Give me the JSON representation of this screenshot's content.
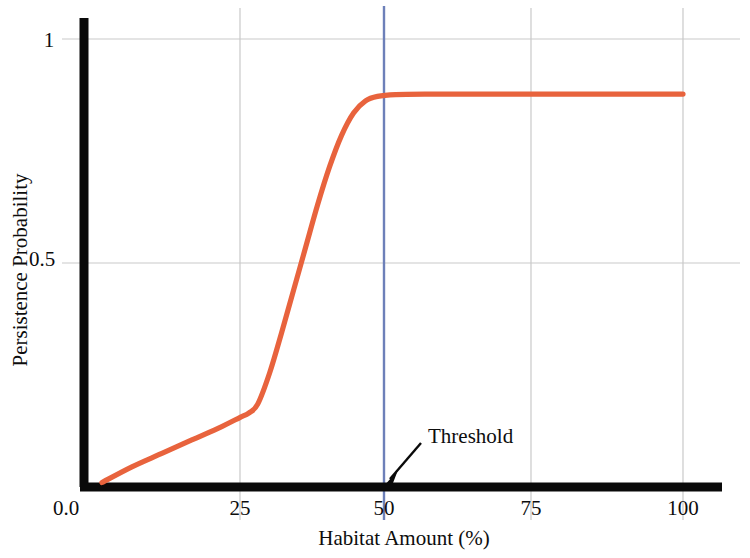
{
  "chart_data": {
    "type": "line",
    "title": "",
    "xlabel": "Habitat Amount (%)",
    "ylabel": "Persistence Probability",
    "xlim": [
      0,
      104
    ],
    "ylim": [
      0,
      1.09
    ],
    "grid": true,
    "legend": "none",
    "xticks": [
      {
        "value": 0,
        "label": "0.0"
      },
      {
        "value": 25,
        "label": "25"
      },
      {
        "value": 50,
        "label": "50"
      },
      {
        "value": 75,
        "label": "75"
      },
      {
        "value": 100,
        "label": "100"
      }
    ],
    "yticks": [
      {
        "value": 0.5,
        "label": "0.5"
      },
      {
        "value": 1.0,
        "label": "1"
      }
    ],
    "series": [
      {
        "name": "persistence-curve",
        "color": "#E8633D",
        "x": [
          3,
          8,
          13,
          18,
          23,
          26,
          27.5,
          29,
          31,
          33,
          35,
          37,
          39,
          41,
          43,
          45,
          47,
          49,
          52,
          58,
          66,
          75,
          85,
          95,
          100
        ],
        "values": [
          0.01,
          0.045,
          0.075,
          0.105,
          0.135,
          0.155,
          0.165,
          0.185,
          0.255,
          0.345,
          0.44,
          0.535,
          0.63,
          0.715,
          0.785,
          0.835,
          0.862,
          0.872,
          0.876,
          0.877,
          0.877,
          0.877,
          0.877,
          0.877,
          0.877
        ]
      }
    ],
    "annotations": [
      {
        "name": "threshold",
        "label": "Threshold",
        "x": 50,
        "line_color": "#6D80B9",
        "arrow_from": [
          420,
          444
        ],
        "arrow_to": [
          385,
          484
        ]
      }
    ]
  },
  "axes": {
    "axis_color": "#0a0a0a",
    "grid_color": "#c9c9c9"
  }
}
